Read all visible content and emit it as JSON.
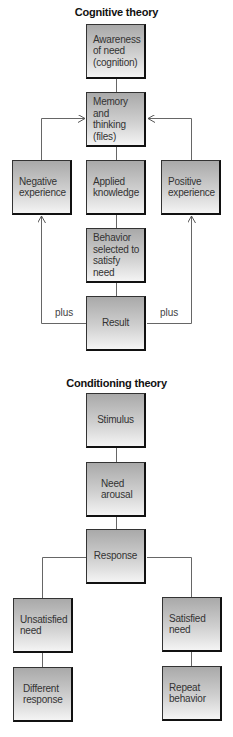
{
  "cognitive": {
    "title": "Cognitive theory",
    "boxes": {
      "awareness": "Awareness of need (cognition)",
      "memory": "Memory and thinking (files)",
      "negative": "Negative experience",
      "applied": "Applied knowledge",
      "positive": "Positive experience",
      "behavior": "Behavior selected to satisfy need",
      "result": "Result"
    },
    "labels": {
      "plus_left": "plus",
      "plus_right": "plus"
    }
  },
  "conditioning": {
    "title": "Conditioning theory",
    "boxes": {
      "stimulus": "Stimulus",
      "need_arousal": "Need arousal",
      "response": "Response",
      "unsatisfied": "Unsatisfied need",
      "satisfied": "Satisfied need",
      "different": "Different response",
      "repeat": "Repeat behavior"
    }
  },
  "colors": {
    "box_top": "#a9a9a9",
    "box_bottom": "#f4f4f4",
    "line": "#555555",
    "shadow": "#111111"
  }
}
